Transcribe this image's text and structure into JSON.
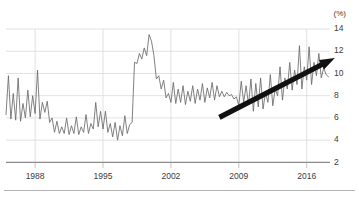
{
  "chart_data": {
    "type": "line",
    "title": "",
    "subtitle": "",
    "xlabel": "",
    "ylabel": "",
    "unit_label": "(%)",
    "grid": true,
    "legend": false,
    "legend_position": "none",
    "xlim": [
      1985.0,
      2018.4
    ],
    "ylim": [
      2,
      14
    ],
    "xticks": [
      1988,
      1995,
      2002,
      2009,
      2016
    ],
    "xtick_labels": [
      "1988",
      "1995",
      "2002",
      "2009",
      "2016"
    ],
    "yticks": [
      2,
      4,
      6,
      8,
      10,
      12,
      14
    ],
    "ytick_labels": [
      "2",
      "4",
      "6",
      "8",
      "10",
      "12",
      "14"
    ],
    "ytick_side": "right",
    "series": [
      {
        "name": "rate",
        "color": "#6a6a6a",
        "x": [
          1985.0,
          1985.25,
          1985.5,
          1985.75,
          1986.0,
          1986.25,
          1986.5,
          1986.75,
          1987.0,
          1987.25,
          1987.5,
          1987.75,
          1988.0,
          1988.25,
          1988.5,
          1988.75,
          1989.0,
          1989.25,
          1989.5,
          1989.75,
          1990.0,
          1990.25,
          1990.5,
          1990.75,
          1991.0,
          1991.25,
          1991.5,
          1991.75,
          1992.0,
          1992.25,
          1992.5,
          1992.75,
          1993.0,
          1993.25,
          1993.5,
          1993.75,
          1994.0,
          1994.25,
          1994.5,
          1994.75,
          1995.0,
          1995.25,
          1995.5,
          1995.75,
          1996.0,
          1996.25,
          1996.5,
          1996.75,
          1997.0,
          1997.25,
          1997.5,
          1997.75,
          1998.0,
          1998.25,
          1998.5,
          1998.75,
          1999.0,
          1999.25,
          1999.5,
          1999.75,
          2000.0,
          2000.25,
          2000.5,
          2000.75,
          2001.0,
          2001.25,
          2001.5,
          2001.75,
          2002.0,
          2002.25,
          2002.5,
          2002.75,
          2003.0,
          2003.25,
          2003.5,
          2003.75,
          2004.0,
          2004.25,
          2004.5,
          2004.75,
          2005.0,
          2005.25,
          2005.5,
          2005.75,
          2006.0,
          2006.25,
          2006.5,
          2006.75,
          2007.0,
          2007.25,
          2007.5,
          2007.75,
          2008.0,
          2008.25,
          2008.5,
          2008.75,
          2009.0,
          2009.25,
          2009.5,
          2009.75,
          2010.0,
          2010.25,
          2010.5,
          2010.75,
          2011.0,
          2011.25,
          2011.5,
          2011.75,
          2012.0,
          2012.25,
          2012.5,
          2012.75,
          2013.0,
          2013.25,
          2013.5,
          2013.75,
          2014.0,
          2014.25,
          2014.5,
          2014.75,
          2015.0,
          2015.25,
          2015.5,
          2015.75,
          2016.0,
          2016.25,
          2016.5,
          2016.75,
          2017.0,
          2017.25,
          2017.5,
          2017.75,
          2018.0,
          2018.25
        ],
        "y": [
          6.3,
          9.8,
          5.9,
          8.2,
          5.8,
          9.6,
          5.7,
          7.3,
          6.0,
          8.5,
          6.1,
          8.0,
          6.4,
          10.3,
          5.9,
          7.4,
          6.5,
          7.5,
          5.6,
          6.0,
          4.7,
          5.7,
          4.6,
          5.2,
          4.6,
          6.0,
          4.5,
          5.3,
          4.6,
          6.1,
          4.5,
          5.2,
          4.7,
          6.3,
          4.6,
          5.5,
          5.0,
          7.4,
          5.2,
          6.6,
          5.0,
          6.6,
          4.7,
          5.5,
          4.3,
          5.6,
          4.0,
          5.3,
          4.4,
          6.2,
          4.6,
          5.4,
          5.6,
          11.0,
          10.9,
          11.8,
          11.3,
          12.3,
          11.6,
          13.5,
          12.9,
          11.6,
          9.5,
          9.8,
          8.6,
          9.4,
          7.8,
          8.2,
          7.4,
          9.2,
          7.3,
          8.6,
          7.4,
          8.9,
          7.2,
          8.4,
          7.5,
          8.9,
          7.3,
          8.6,
          7.6,
          9.1,
          7.4,
          8.7,
          7.8,
          9.2,
          7.6,
          8.9,
          7.9,
          8.4,
          7.9,
          8.3,
          8.0,
          8.1,
          7.7,
          7.9,
          7.1,
          9.3,
          7.4,
          8.9,
          7.2,
          9.5,
          6.6,
          9.1,
          7.0,
          9.6,
          6.8,
          8.3,
          7.4,
          9.9,
          7.1,
          8.6,
          8.0,
          10.6,
          7.6,
          9.6,
          8.6,
          11.0,
          8.5,
          10.3,
          9.0,
          12.5,
          8.6,
          10.6,
          9.4,
          12.4,
          9.0,
          11.0,
          9.8,
          11.8,
          9.6,
          10.5,
          9.9,
          9.7
        ]
      }
    ],
    "annotations": [
      {
        "type": "arrow",
        "label": "upward-trend-arrow",
        "color": "#111111",
        "x_start": 2007.0,
        "y_start": 6.05,
        "x_end": 2018.9,
        "y_end": 11.4
      }
    ]
  }
}
